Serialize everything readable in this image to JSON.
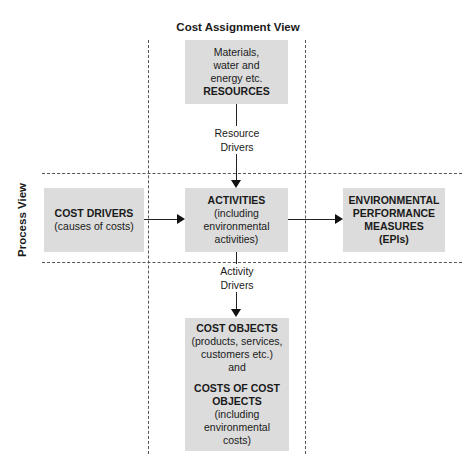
{
  "diagram": {
    "title_top": "Cost Assignment View",
    "title_side": "Process View",
    "resources_box": {
      "lines": [
        "Materials,",
        "water and",
        "energy etc."
      ],
      "heading": "RESOURCES"
    },
    "resource_drivers_label": [
      "Resource",
      "Drivers"
    ],
    "cost_drivers_box": {
      "heading": "COST DRIVERS",
      "sub": "(causes of costs)"
    },
    "activities_box": {
      "heading": "ACTIVITIES",
      "lines": [
        "(including",
        "environmental",
        "activities)"
      ]
    },
    "epis_box": {
      "lines": [
        "ENVIRONMENTAL",
        "PERFORMANCE",
        "MEASURES",
        "(EPIs)"
      ]
    },
    "activity_drivers_label": [
      "Activity",
      "Drivers"
    ],
    "cost_objects_box": {
      "heading": "COST OBJECTS",
      "sub_lines": [
        "(products, services,",
        "customers etc.)"
      ],
      "joiner": "and",
      "heading2_lines": [
        "COSTS OF COST",
        "OBJECTS"
      ],
      "sub2_lines": [
        "(including",
        "environmental",
        "costs)"
      ]
    },
    "edges": [
      {
        "from": "RESOURCES",
        "to": "ACTIVITIES",
        "label": "Resource Drivers"
      },
      {
        "from": "COST DRIVERS",
        "to": "ACTIVITIES",
        "label": ""
      },
      {
        "from": "ACTIVITIES",
        "to": "ENVIRONMENTAL PERFORMANCE MEASURES (EPIs)",
        "label": ""
      },
      {
        "from": "ACTIVITIES",
        "to": "COST OBJECTS",
        "label": "Activity Drivers"
      }
    ],
    "colors": {
      "box_fill": "#dcdcdc",
      "line": "#222222",
      "dash": "#555555"
    }
  }
}
